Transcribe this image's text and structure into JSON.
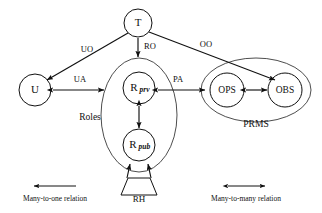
{
  "diagram": {
    "nodes": {
      "t": {
        "label": "T",
        "cx": 138,
        "cy": 23,
        "r": 14
      },
      "u": {
        "label": "U",
        "cx": 35,
        "cy": 90,
        "r": 16
      },
      "rprv": {
        "base": "R",
        "sub": "prv",
        "cx": 139,
        "cy": 88,
        "r": 16
      },
      "rpub": {
        "base": "R",
        "sub": "pub",
        "cx": 139,
        "cy": 145,
        "r": 16
      },
      "ops": {
        "label": "OPS",
        "cx": 227,
        "cy": 90,
        "r": 17
      },
      "obs": {
        "label": "OBS",
        "cx": 285,
        "cy": 90,
        "r": 17
      }
    },
    "groups": {
      "roles": {
        "label": "Roles",
        "cx": 139,
        "cy": 115,
        "rx": 38,
        "ry": 57,
        "label_x": 90,
        "label_y": 118
      },
      "prms": {
        "label": "PRMS",
        "cx": 256,
        "cy": 90,
        "rx": 55,
        "ry": 32,
        "label_x": 256,
        "label_y": 125
      }
    },
    "hierarchy_shape": {
      "label": "RH",
      "label_x": 139,
      "label_y": 199
    },
    "edge_labels": {
      "uo": {
        "text": "UO",
        "x": 87,
        "y": 50
      },
      "ro": {
        "text": "RO",
        "x": 150,
        "y": 47
      },
      "oo": {
        "text": "OO",
        "x": 206,
        "y": 45
      },
      "ua": {
        "text": "UA",
        "x": 80,
        "y": 80
      },
      "pa": {
        "text": "PA",
        "x": 178,
        "y": 80
      }
    },
    "legend": {
      "many_to_one": {
        "text": "Many-to-one relation",
        "x": 55,
        "y": 199,
        "arrow_x1": 76,
        "arrow_x2": 34,
        "arrow_y": 186
      },
      "many_to_many": {
        "text": "Many-to-many relation",
        "x": 246,
        "y": 199,
        "arrow_x1": 225,
        "arrow_x2": 267,
        "arrow_y": 186
      }
    },
    "colors": {
      "stroke": "#101010",
      "background": "#ffffff",
      "text": "#101010"
    }
  }
}
